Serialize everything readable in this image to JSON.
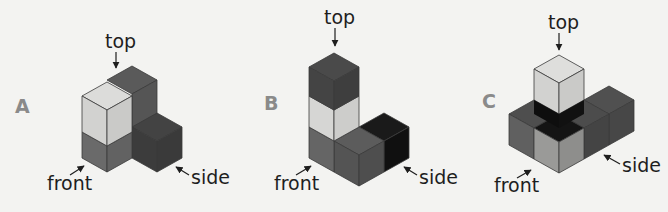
{
  "colors": {
    "background": "#f3f3f1",
    "light": "#d6d6d4",
    "light_side": "#c8c8c6",
    "medium": "#6e6e6e",
    "medium_side": "#5f5f5f",
    "dark": "#4a4a4a",
    "dark_side": "#3c3c3c",
    "black": "#141414",
    "label_text": "#1e1e1e",
    "letter_text": "#8a8a8a"
  },
  "figures": [
    {
      "id": "A",
      "letter": "A",
      "labels": {
        "top": "top",
        "front": "front",
        "side": "side"
      }
    },
    {
      "id": "B",
      "letter": "B",
      "labels": {
        "top": "top",
        "front": "front",
        "side": "side"
      }
    },
    {
      "id": "C",
      "letter": "C",
      "labels": {
        "top": "top",
        "front": "front",
        "side": "side"
      }
    }
  ]
}
